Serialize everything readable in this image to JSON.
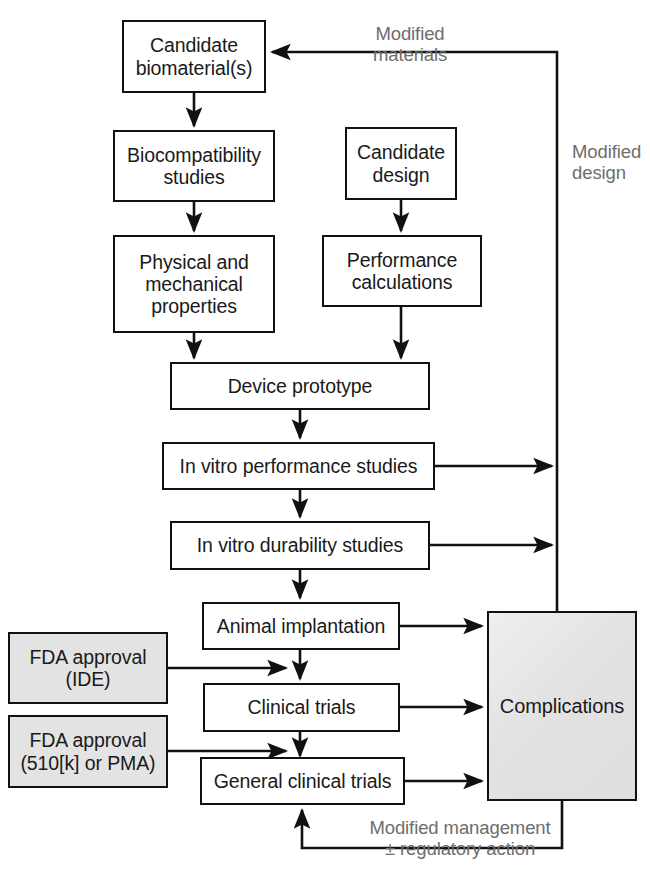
{
  "diagram": {
    "colors": {
      "box_border": "#111111",
      "box_fill": "#ffffff",
      "shaded_fill": "#e3e3e3",
      "complications_fill": "#e6e6e6",
      "label_text": "#6d6d6d",
      "line": "#111111"
    },
    "nodes": [
      {
        "id": "candidate-biomaterials",
        "label": "Candidate\nbiomaterial(s)",
        "style": "plain"
      },
      {
        "id": "biocompatibility-studies",
        "label": "Biocompatibility\nstudies",
        "style": "plain"
      },
      {
        "id": "physical-mechanical-properties",
        "label": "Physical and\nmechanical\nproperties",
        "style": "plain"
      },
      {
        "id": "candidate-design",
        "label": "Candidate\ndesign",
        "style": "plain"
      },
      {
        "id": "performance-calculations",
        "label": "Performance\ncalculations",
        "style": "plain"
      },
      {
        "id": "device-prototype",
        "label": "Device prototype",
        "style": "plain"
      },
      {
        "id": "in-vitro-performance-studies",
        "label": "In vitro performance studies",
        "style": "plain"
      },
      {
        "id": "in-vitro-durability-studies",
        "label": "In vitro durability studies",
        "style": "plain"
      },
      {
        "id": "animal-implantation",
        "label": "Animal implantation",
        "style": "plain"
      },
      {
        "id": "clinical-trials",
        "label": "Clinical trials",
        "style": "plain"
      },
      {
        "id": "general-clinical-trials",
        "label": "General clinical trials",
        "style": "plain"
      },
      {
        "id": "fda-approval-ide",
        "label": "FDA approval\n(IDE)",
        "style": "shaded"
      },
      {
        "id": "fda-approval-510k-pma",
        "label": "FDA approval\n(510[k] or PMA)",
        "style": "shaded"
      },
      {
        "id": "complications",
        "label": "Complications",
        "style": "shaded-gradient"
      }
    ],
    "edge_labels": [
      {
        "id": "modified-materials",
        "text": "Modified\nmaterials"
      },
      {
        "id": "modified-design",
        "text": "Modified\ndesign"
      },
      {
        "id": "modified-management",
        "text": "Modified management\n± regulatory action"
      }
    ]
  }
}
